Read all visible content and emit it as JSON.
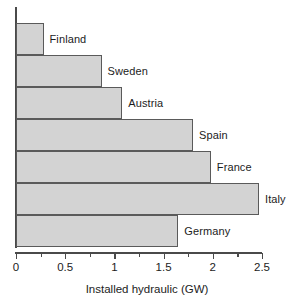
{
  "chart_data": {
    "type": "bar",
    "orientation": "horizontal",
    "title": "",
    "xlabel": "Installed hydraulic (GW)",
    "ylabel": "",
    "categories": [
      "Finland",
      "Sweden",
      "Austria",
      "Spain",
      "France",
      "Italy",
      "Germany"
    ],
    "values": [
      0.28,
      0.87,
      1.08,
      1.8,
      1.98,
      2.47,
      1.65
    ],
    "xlim": [
      0,
      2.5
    ],
    "xticks": [
      0,
      0.5,
      1,
      1.5,
      2,
      2.5
    ],
    "xtick_labels": [
      "0",
      "0.5",
      "1",
      "1.5",
      "2",
      "2.5"
    ],
    "minor_tick_step": 0.25,
    "grid": false,
    "legend": null,
    "bar_fill_color": "#d3d3d3",
    "bar_edge_color": "#5a5a5a",
    "axis_color": "#4a4a4a",
    "label_placement": "right-of-bar-end"
  }
}
